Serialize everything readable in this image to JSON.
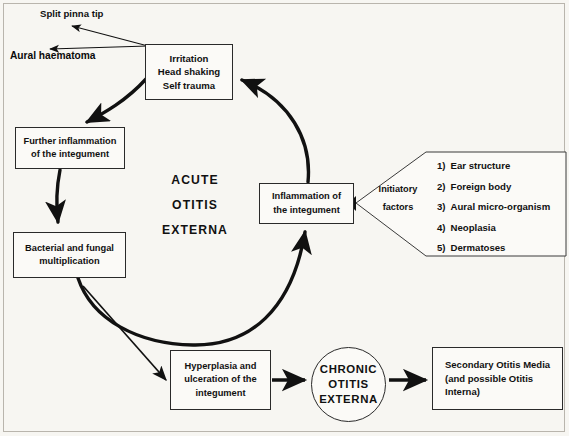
{
  "diagram": {
    "center_label": [
      "ACUTE",
      "OTITIS",
      "EXTERNA"
    ],
    "outcome_labels": {
      "split_pinna": "Split pinna tip",
      "aural_haematoma": "Aural haematoma"
    },
    "nodes": {
      "irritation": [
        "Irritation",
        "Head shaking",
        "Self trauma"
      ],
      "further_inflammation": [
        "Further inflammation",
        "of the integument"
      ],
      "bacterial": [
        "Bacterial and fungal",
        "multiplication"
      ],
      "inflammation": [
        "Inflammation of",
        "the integument"
      ],
      "hyperplasia": [
        "Hyperplasia and",
        "ulceration of the",
        "integument"
      ],
      "chronic": [
        "CHRONIC",
        "OTITIS",
        "EXTERNA"
      ],
      "secondary": [
        "Secondary Otitis Media",
        "(and possible Otitis",
        "Interna)"
      ]
    },
    "initiatory": {
      "label": [
        "Initiatory",
        "factors"
      ],
      "items": [
        {
          "num": "1)",
          "text": "Ear structure"
        },
        {
          "num": "2)",
          "text": "Foreign body"
        },
        {
          "num": "3)",
          "text": "Aural micro-organism"
        },
        {
          "num": "4)",
          "text": "Neoplasia"
        },
        {
          "num": "5)",
          "text": "Dermatoses"
        }
      ]
    },
    "colors": {
      "ink": "#111111",
      "paper": "#f7f6f2",
      "frame": "#b9b5ad"
    }
  }
}
